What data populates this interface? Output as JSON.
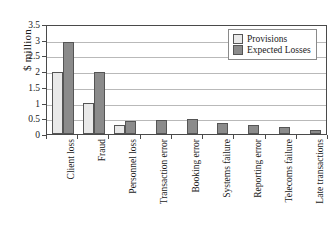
{
  "chart_data": {
    "type": "bar",
    "title": "",
    "xlabel": "",
    "ylabel": "$ million",
    "ylim": [
      0,
      3.5
    ],
    "yticks": [
      "0",
      "0.5",
      "1",
      "1.5",
      "2",
      "2.5",
      "3",
      "3.5"
    ],
    "grid": true,
    "legend_position": "top-right",
    "categories": [
      "Client loss",
      "Fraud",
      "Personnel loss",
      "Transaction error",
      "Booking error",
      "Systems failure",
      "Reporting error",
      "Telecoms failure",
      "Late transactions"
    ],
    "series": [
      {
        "name": "Provisions",
        "color": "#e9e9e9",
        "values": [
          2.0,
          1.0,
          0.28,
          0,
          0,
          0,
          0,
          0,
          0
        ]
      },
      {
        "name": "Expected Losses",
        "color": "#8b8b8b",
        "values": [
          3.0,
          2.0,
          0.42,
          0.45,
          0.47,
          0.35,
          0.28,
          0.2,
          0.1
        ]
      }
    ]
  },
  "legend": {
    "items": [
      {
        "label": "Provisions"
      },
      {
        "label": "Expected Losses"
      }
    ]
  }
}
